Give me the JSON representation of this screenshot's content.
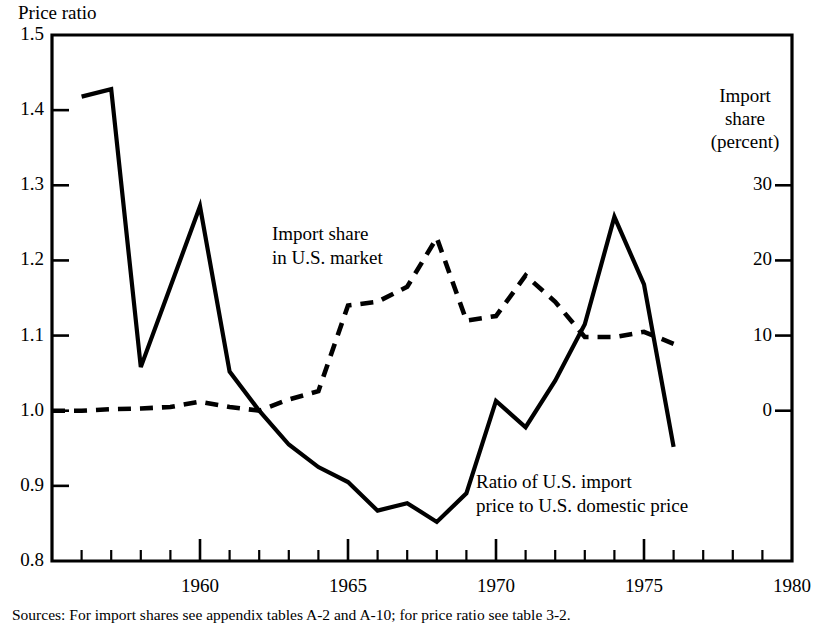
{
  "axis_titles": {
    "left": "Price ratio",
    "right_lines": [
      "Import",
      "share",
      "(percent)"
    ]
  },
  "annotations": {
    "import_share": [
      "Import share",
      "in U.S. market"
    ],
    "price_ratio": [
      "Ratio of U.S. import",
      "price to U.S. domestic price"
    ]
  },
  "source_note": "Sources: For import shares see appendix tables A-2 and A-10; for price ratio see table 3-2.",
  "chart_data": {
    "type": "line",
    "title": "",
    "xlabel": "",
    "ylabel": "Price ratio",
    "y2label": "Import share (percent)",
    "xlim": [
      1955,
      1980
    ],
    "ylim": [
      0.8,
      1.5
    ],
    "y2lim": [
      -20,
      50
    ],
    "grid": false,
    "legend_position": "inline-annotations",
    "ytick_labels": [
      "0.8",
      "0.9",
      "1.0",
      "1.1",
      "1.2",
      "1.3",
      "1.4",
      "1.5"
    ],
    "ytick_values": [
      0.8,
      0.9,
      1.0,
      1.1,
      1.2,
      1.3,
      1.4,
      1.5
    ],
    "y2tick_labels": [
      "0",
      "10",
      "20",
      "30"
    ],
    "y2tick_values": [
      0,
      10,
      20,
      30
    ],
    "y2tick_ratio_positions": [
      1.0,
      1.1,
      1.2,
      1.3
    ],
    "xtick_major_labels": [
      "1960",
      "1965",
      "1970",
      "1975",
      "1980"
    ],
    "xtick_major_values": [
      1960,
      1965,
      1970,
      1975,
      1980
    ],
    "xtick_minor_values": [
      1956,
      1957,
      1958,
      1959,
      1961,
      1962,
      1963,
      1964,
      1966,
      1967,
      1968,
      1969,
      1971,
      1972,
      1973,
      1974,
      1976,
      1977,
      1978,
      1979
    ],
    "series": [
      {
        "name": "Ratio of U.S. import price to U.S. domestic price",
        "style": "solid",
        "axis": "left",
        "unit": "price ratio",
        "x": [
          1956,
          1957,
          1958,
          1959,
          1960,
          1961,
          1962,
          1963,
          1964,
          1965,
          1966,
          1967,
          1968,
          1969,
          1970,
          1971,
          1972,
          1973,
          1974,
          1975,
          1976
        ],
        "values": [
          1.418,
          1.428,
          1.058,
          1.165,
          1.272,
          1.052,
          1.0,
          0.955,
          0.925,
          0.905,
          0.867,
          0.877,
          0.852,
          0.89,
          1.013,
          0.978,
          1.04,
          1.115,
          1.258,
          1.168,
          0.952
        ]
      },
      {
        "name": "Import share in U.S. market",
        "style": "dashed",
        "axis": "right",
        "unit": "percent",
        "x": [
          1955,
          1956,
          1957,
          1958,
          1959,
          1960,
          1961,
          1962,
          1963,
          1964,
          1965,
          1966,
          1967,
          1968,
          1969,
          1970,
          1971,
          1972,
          1973,
          1974,
          1975,
          1976
        ],
        "values": [
          0.0,
          0.0,
          0.2,
          0.3,
          0.5,
          1.2,
          0.5,
          0.0,
          1.5,
          2.6,
          14.0,
          14.5,
          16.5,
          23.0,
          12.0,
          12.6,
          18.0,
          14.5,
          9.8,
          9.8,
          10.5,
          8.9
        ],
        "values_as_ratio_scale": [
          1.0,
          1.0,
          1.002,
          1.003,
          1.005,
          1.012,
          1.005,
          1.0,
          1.015,
          1.026,
          1.14,
          1.145,
          1.165,
          1.23,
          1.12,
          1.126,
          1.18,
          1.145,
          1.098,
          1.098,
          1.105,
          1.089
        ]
      }
    ]
  }
}
